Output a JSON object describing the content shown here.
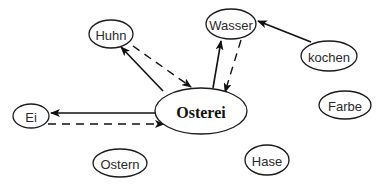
{
  "diagram": {
    "type": "concept-map",
    "central_node": "osterei",
    "nodes": [
      {
        "id": "huhn",
        "label": "Huhn",
        "cx": 111,
        "cy": 34,
        "rx": 22,
        "ry": 14,
        "central": false
      },
      {
        "id": "wasser",
        "label": "Wasser",
        "cx": 231,
        "cy": 24,
        "rx": 25,
        "ry": 15,
        "central": false
      },
      {
        "id": "kochen",
        "label": "kochen",
        "cx": 329,
        "cy": 56,
        "rx": 28,
        "ry": 15,
        "central": false
      },
      {
        "id": "osterei",
        "label": "Osterei",
        "cx": 201,
        "cy": 111,
        "rx": 46,
        "ry": 23,
        "central": true
      },
      {
        "id": "ei",
        "label": "Ei",
        "cx": 31,
        "cy": 116,
        "rx": 18,
        "ry": 12,
        "central": false
      },
      {
        "id": "farbe",
        "label": "Farbe",
        "cx": 345,
        "cy": 105,
        "rx": 26,
        "ry": 14,
        "central": false
      },
      {
        "id": "ostern",
        "label": "Ostern",
        "cx": 120,
        "cy": 163,
        "rx": 27,
        "ry": 14,
        "central": false
      },
      {
        "id": "hase",
        "label": "Hase",
        "cx": 267,
        "cy": 160,
        "rx": 22,
        "ry": 15,
        "central": false
      }
    ],
    "edges": [
      {
        "from": "osterei",
        "to": "huhn",
        "style": "solid",
        "x1": 163,
        "y1": 91,
        "x2": 121,
        "y2": 47
      },
      {
        "from": "huhn",
        "to": "osterei",
        "style": "dashed",
        "x1": 133,
        "y1": 46,
        "x2": 191,
        "y2": 87
      },
      {
        "from": "osterei",
        "to": "wasser",
        "style": "solid",
        "x1": 213,
        "y1": 88,
        "x2": 221,
        "y2": 41
      },
      {
        "from": "wasser",
        "to": "osterei",
        "style": "dashed",
        "x1": 241,
        "y1": 40,
        "x2": 225,
        "y2": 92
      },
      {
        "from": "kochen",
        "to": "wasser",
        "style": "solid",
        "x1": 311,
        "y1": 42,
        "x2": 258,
        "y2": 21
      },
      {
        "from": "osterei",
        "to": "ei",
        "style": "solid",
        "x1": 155,
        "y1": 113,
        "x2": 51,
        "y2": 113
      },
      {
        "from": "ei",
        "to": "osterei",
        "style": "dashed",
        "x1": 48,
        "y1": 124,
        "x2": 164,
        "y2": 124
      }
    ]
  }
}
